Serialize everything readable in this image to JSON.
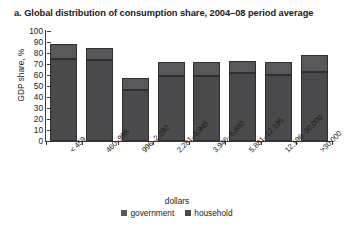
{
  "chart_data": {
    "type": "bar",
    "title": "a. Global distribution of consumption share, 2004–08 period average",
    "xlabel": "dollars",
    "ylabel": "GDP share, %",
    "ylim": [
      0,
      100
    ],
    "ytick_step": 10,
    "yticks": [
      "100",
      "90",
      "80",
      "70",
      "60",
      "50",
      "40",
      "30",
      "20",
      "10",
      "0"
    ],
    "grid": false,
    "stacked": true,
    "legend_position": "bottom",
    "categories": [
      "< 459",
      "460–995",
      "996–2,280",
      "2,281–3,945",
      "3,946–5,880",
      "5,881–12,195",
      "12,196–30,000",
      ">30,000"
    ],
    "series": [
      {
        "name": "household",
        "color": "#4a4a4c",
        "values": [
          75,
          74,
          46,
          59,
          59,
          62,
          60,
          63
        ]
      },
      {
        "name": "government",
        "color": "#58585a",
        "values": [
          13,
          11,
          11,
          13,
          13,
          11,
          12,
          15
        ]
      }
    ],
    "totals": [
      88,
      85,
      57,
      72,
      72,
      73,
      72,
      78
    ]
  },
  "legend": {
    "items": [
      {
        "label": "government",
        "key": "government"
      },
      {
        "label": "household",
        "key": "household"
      }
    ]
  }
}
